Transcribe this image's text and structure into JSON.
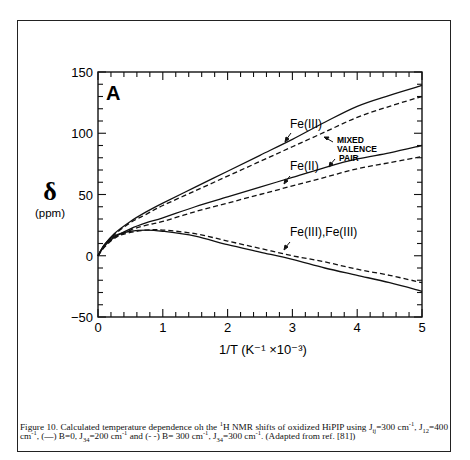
{
  "chart_data": {
    "type": "line",
    "panel_label": "A",
    "title": "",
    "xlabel": "1/T (K⁻¹ ×10⁻³)",
    "ylabel": "δ",
    "ylabel_unit": "(ppm)",
    "xlim": [
      0,
      5
    ],
    "ylim": [
      -50,
      150
    ],
    "x_ticks": [
      0,
      1,
      2,
      3,
      4,
      5
    ],
    "y_ticks": [
      -50,
      0,
      50,
      100,
      150
    ],
    "x_minor_step": 0.2,
    "y_minor_step": 10,
    "grid": false,
    "x": [
      0,
      0.1,
      0.25,
      0.5,
      0.75,
      1,
      1.5,
      2,
      2.5,
      3,
      3.5,
      4,
      4.5,
      5
    ],
    "series": [
      {
        "name": "Fe(III) (B=0, J34=200)",
        "style": "solid",
        "values": [
          0,
          9,
          18,
          28,
          36,
          43,
          56,
          69,
          82,
          95,
          109,
          122,
          131,
          139
        ]
      },
      {
        "name": "Fe(III) (B=300, J34=300)",
        "style": "dashed",
        "values": [
          0,
          8,
          17,
          27,
          34,
          41,
          53,
          65,
          77,
          89,
          101,
          113,
          122,
          130
        ]
      },
      {
        "name": "Fe(II) (B=0, J34=200)",
        "style": "solid",
        "values": [
          0,
          8,
          15,
          22,
          27,
          31,
          40,
          48,
          56,
          64,
          72,
          79,
          84,
          90
        ]
      },
      {
        "name": "Fe(II) (B=300, J34=300)",
        "style": "dashed",
        "values": [
          0,
          7,
          14,
          21,
          25,
          28,
          36,
          43,
          50,
          57,
          64,
          71,
          76,
          81
        ]
      },
      {
        "name": "Fe(III),Fe(III) (B=0, J34=200)",
        "style": "solid",
        "values": [
          0,
          9,
          16,
          20,
          21,
          20,
          16,
          9,
          3,
          -3,
          -10,
          -16,
          -22,
          -29
        ]
      },
      {
        "name": "Fe(III),Fe(III) (B=300, J34=300)",
        "style": "dashed",
        "values": [
          0,
          8,
          15,
          19,
          21,
          21,
          18,
          12,
          6,
          0,
          -5,
          -11,
          -16,
          -22
        ]
      }
    ],
    "annotations": [
      {
        "text": "Fe(III)",
        "x": 2.9,
        "y": 101
      },
      {
        "text": "Fe(II)",
        "x": 2.9,
        "y": 67
      },
      {
        "text": "MIXED VALENCE PAIR",
        "x": 3.7,
        "y": 85
      },
      {
        "text": "Fe(III),Fe(III)",
        "x": 2.9,
        "y": 26
      }
    ]
  },
  "labels": {
    "panel": "A",
    "ylabel_symbol": "δ",
    "ylabel_unit": "(ppm)",
    "xlabel": "1/T (K⁻¹ ×10⁻³)",
    "ann_fe3": "Fe(III)",
    "ann_fe2": "Fe(II)",
    "ann_mixed1": "MIXED",
    "ann_mixed2": "VALENCE",
    "ann_mixed3": "PAIR",
    "ann_fe3fe3": "Fe(III),Fe(III)"
  },
  "caption": {
    "p1": "Figure 10. Calculated temperature dependence oh the ",
    "sup1": "1",
    "p2": "H NMR shifts of oxidized HiPIP using J",
    "sub1": "ij",
    "p3": "=300 cm",
    "sup2": "-1",
    "p4": ", J",
    "sub2": "12",
    "p5": "=400 cm",
    "sup3": "-1",
    "p6": ", (—) B=0, J",
    "sub3": "34",
    "p7": "=200 cm",
    "sup4": "-1",
    "p8": " and (- -) B= 300 cm",
    "sup5": "-1",
    "p9": ", J",
    "sub4": "34",
    "p10": "=300 cm",
    "sup6": "-1",
    "p11": ". (Adapted from ref. [81])"
  }
}
